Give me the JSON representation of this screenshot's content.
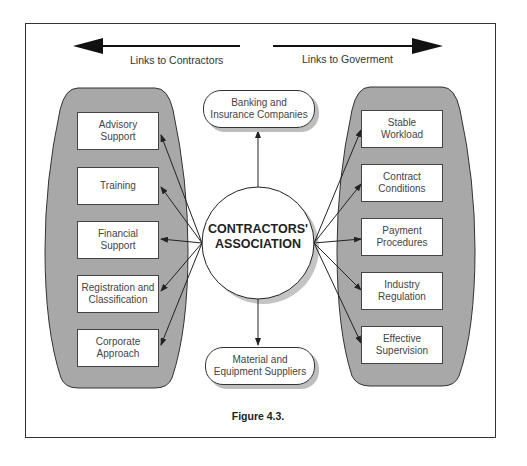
{
  "figure": {
    "caption": "Figure 4.3.",
    "center": {
      "line1": "CONTRACTORS'",
      "line2": "ASSOCIATION"
    },
    "direction_labels": {
      "left": "Links to Contractors",
      "right": "Links to Goverment"
    },
    "top_node": {
      "line1": "Banking and",
      "line2": "Insurance Companies"
    },
    "bottom_node": {
      "line1": "Material and",
      "line2": "Equipment Suppliers"
    },
    "left_group": [
      {
        "line1": "Advisory",
        "line2": "Support"
      },
      {
        "line1": "Training",
        "line2": ""
      },
      {
        "line1": "Financial",
        "line2": "Support"
      },
      {
        "line1": "Registration and",
        "line2": "Classification"
      },
      {
        "line1": "Corporate",
        "line2": "Approach"
      }
    ],
    "right_group": [
      {
        "line1": "Stable",
        "line2": "Workload"
      },
      {
        "line1": "Contract",
        "line2": "Conditions"
      },
      {
        "line1": "Payment",
        "line2": "Procedures"
      },
      {
        "line1": "Industry",
        "line2": "Regulation"
      },
      {
        "line1": "Effective",
        "line2": "Supervision"
      }
    ],
    "colors": {
      "capsule_fill": "#a8a8a8",
      "line": "#222222",
      "shadow": "#bdbdbd"
    }
  }
}
